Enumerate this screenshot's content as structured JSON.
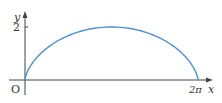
{
  "figure": {
    "type": "function-graph",
    "axes": {
      "x_label": "x",
      "y_label": "y",
      "origin_label": "O",
      "x_tick_label": "2π",
      "y_tick_label": "2"
    },
    "curve": {
      "description": "cycloid arch from 0 to 2π with maximum height 2",
      "color": "#4a90d9",
      "x_range": [
        0,
        6.2832
      ],
      "y_max": 2
    }
  },
  "chart_data": {
    "type": "line",
    "title": "",
    "xlabel": "x",
    "ylabel": "y",
    "x_ticks": [
      "2π"
    ],
    "y_ticks": [
      "2"
    ],
    "series": [
      {
        "name": "curve",
        "x": [
          0,
          0.5,
          1.0,
          1.57,
          2.0,
          2.5,
          3.14,
          3.78,
          4.28,
          4.71,
          5.28,
          5.78,
          6.28
        ],
        "y": [
          0,
          0.75,
          1.05,
          1.35,
          1.55,
          1.75,
          2.0,
          1.75,
          1.55,
          1.35,
          1.05,
          0.75,
          0
        ]
      }
    ],
    "xlim": [
      0,
      6.28
    ],
    "ylim": [
      0,
      2
    ],
    "grid": false,
    "legend": false
  }
}
